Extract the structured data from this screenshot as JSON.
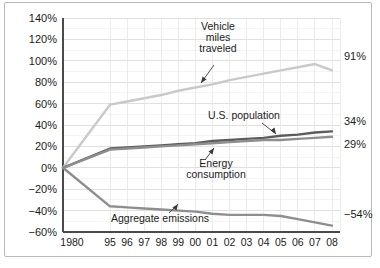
{
  "chart_data": {
    "type": "line",
    "title": "",
    "subtitle": "",
    "xlabel": "",
    "ylabel": "",
    "grid": true,
    "legend_position": "inline-annotations",
    "ylim": [
      -60,
      140
    ],
    "yticks": [
      -60,
      -40,
      -20,
      0,
      20,
      40,
      60,
      80,
      100,
      120,
      140
    ],
    "ytick_labels": [
      "-60%",
      "-40%",
      "-20%",
      "0%",
      "20%",
      "40%",
      "60%",
      "80%",
      "100%",
      "120%",
      "140%"
    ],
    "x": [
      "1980",
      "95",
      "96",
      "97",
      "98",
      "99",
      "00",
      "01",
      "02",
      "03",
      "04",
      "05",
      "06",
      "07",
      "08"
    ],
    "xtick_labels": [
      "1980",
      "95",
      "96",
      "97",
      "98",
      "99",
      "00",
      "01",
      "02",
      "03",
      "04",
      "05",
      "06",
      "07",
      "08"
    ],
    "series": [
      {
        "name": "Vehicle miles traveled",
        "color": "#c9c9c9",
        "end_label": "91%",
        "values": [
          0,
          59,
          62,
          65,
          68,
          72,
          75,
          78,
          82,
          85,
          88,
          91,
          94,
          97,
          91
        ]
      },
      {
        "name": "U.S. population",
        "color": "#5c5c5c",
        "end_label": "34%",
        "values": [
          0,
          18,
          19,
          20,
          21,
          22,
          23,
          25,
          26,
          27,
          28,
          30,
          31,
          33,
          34
        ]
      },
      {
        "name": "Energy consumption",
        "color": "#8e8e8e",
        "end_label": "29%",
        "values": [
          0,
          17,
          18,
          19,
          20,
          21,
          22,
          23,
          24,
          25,
          26,
          26,
          27,
          28,
          29
        ]
      },
      {
        "name": "Aggregate emissions",
        "color": "#8e8e8e",
        "end_label": "-54%",
        "values": [
          0,
          -36,
          -37,
          -38,
          -39,
          -40,
          -41,
          -43,
          -44,
          -44,
          -44,
          -45,
          -48,
          -51,
          -54
        ]
      }
    ],
    "annotations": [
      {
        "id": "vehicle-miles-traveled",
        "lines": [
          "Vehicle",
          "miles",
          "traveled"
        ],
        "align": "middle"
      },
      {
        "id": "us-population",
        "lines": [
          "U.S. population"
        ],
        "align": "middle"
      },
      {
        "id": "energy-consumption",
        "lines": [
          "Energy",
          "consumption"
        ],
        "align": "middle"
      },
      {
        "id": "aggregate-emissions",
        "lines": [
          "Aggregate emissions"
        ],
        "align": "middle"
      }
    ],
    "colors": {
      "axis": "#4a4a4a",
      "major_grid": "#d7d7d7",
      "minor_grid": "#ececec",
      "text": "#1b1b1b",
      "background": "#ffffff",
      "frame": "#b9b9b9"
    }
  }
}
